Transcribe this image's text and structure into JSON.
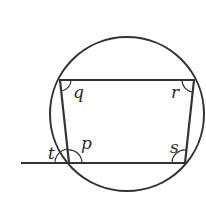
{
  "diagram": {
    "circle": {
      "cx": 127,
      "cy": 114,
      "r": 76
    },
    "vertices": {
      "top_left": [
        60,
        80
      ],
      "top_right": [
        194,
        80
      ],
      "bottom_right": [
        185,
        163
      ],
      "bottom_left": [
        69,
        163
      ]
    },
    "extended_line_start": [
      21,
      163
    ],
    "angles": {
      "q": {
        "label": "q",
        "vertex": "top_left"
      },
      "r": {
        "label": "r",
        "vertex": "top_right"
      },
      "s": {
        "label": "s",
        "vertex": "bottom_right"
      },
      "p": {
        "label": "p",
        "vertex": "bottom_left"
      },
      "t": {
        "label": "t",
        "vertex": "bottom_left",
        "type": "exterior"
      }
    },
    "colors": {
      "stroke": "#333333",
      "background": "#ffffff"
    }
  }
}
